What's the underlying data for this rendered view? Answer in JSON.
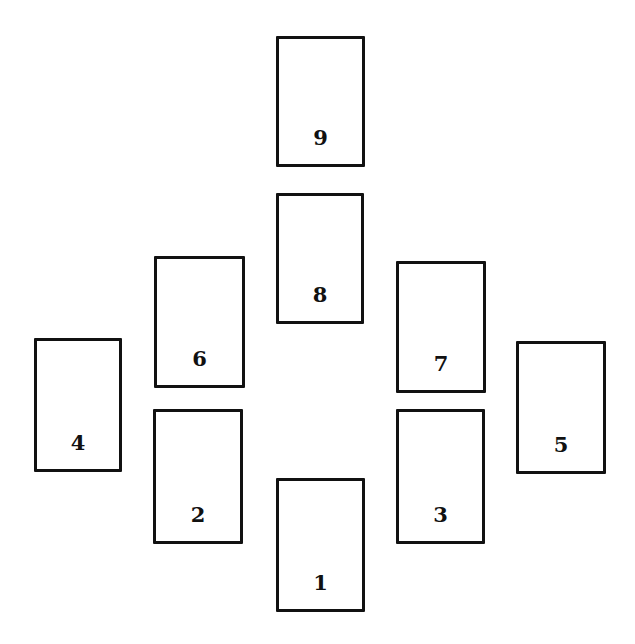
{
  "diagram": {
    "type": "card-spread-layout",
    "colors": {
      "background": "#ffffff",
      "card_border": "#111111",
      "card_fill": "#ffffff",
      "label": "#111111"
    },
    "cards": [
      {
        "label": "9",
        "x": 276,
        "y": 36,
        "w": 89,
        "h": 131
      },
      {
        "label": "8",
        "x": 276,
        "y": 193,
        "w": 88,
        "h": 131
      },
      {
        "label": "6",
        "x": 154,
        "y": 256,
        "w": 91,
        "h": 132
      },
      {
        "label": "7",
        "x": 396,
        "y": 261,
        "w": 90,
        "h": 132
      },
      {
        "label": "4",
        "x": 34,
        "y": 338,
        "w": 88,
        "h": 134
      },
      {
        "label": "5",
        "x": 516,
        "y": 341,
        "w": 90,
        "h": 133
      },
      {
        "label": "2",
        "x": 153,
        "y": 409,
        "w": 90,
        "h": 135
      },
      {
        "label": "3",
        "x": 396,
        "y": 409,
        "w": 89,
        "h": 135
      },
      {
        "label": "1",
        "x": 276,
        "y": 478,
        "w": 89,
        "h": 134
      }
    ]
  }
}
